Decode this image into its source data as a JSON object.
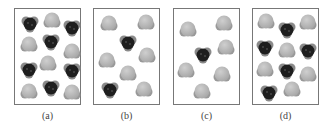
{
  "figure": {
    "panels": [
      {
        "id": "a",
        "label": "(a)",
        "left": 14,
        "molecules": [
          {
            "type": "dark",
            "x": 6,
            "y": 6
          },
          {
            "type": "light",
            "x": 28,
            "y": 3
          },
          {
            "type": "dark",
            "x": 48,
            "y": 10
          },
          {
            "type": "light",
            "x": 5,
            "y": 27
          },
          {
            "type": "dark",
            "x": 27,
            "y": 24
          },
          {
            "type": "light",
            "x": 48,
            "y": 34
          },
          {
            "type": "light",
            "x": 24,
            "y": 46
          },
          {
            "type": "dark",
            "x": 5,
            "y": 52
          },
          {
            "type": "dark",
            "x": 48,
            "y": 53
          },
          {
            "type": "light",
            "x": 5,
            "y": 74
          },
          {
            "type": "dark",
            "x": 27,
            "y": 70
          },
          {
            "type": "light",
            "x": 48,
            "y": 75
          }
        ]
      },
      {
        "id": "b",
        "label": "(b)",
        "left": 93,
        "molecules": [
          {
            "type": "light",
            "x": 6,
            "y": 6
          },
          {
            "type": "light",
            "x": 43,
            "y": 5
          },
          {
            "type": "dark",
            "x": 25,
            "y": 25
          },
          {
            "type": "light",
            "x": 4,
            "y": 43
          },
          {
            "type": "light",
            "x": 44,
            "y": 38
          },
          {
            "type": "light",
            "x": 25,
            "y": 56
          },
          {
            "type": "dark",
            "x": 7,
            "y": 72
          },
          {
            "type": "light",
            "x": 41,
            "y": 72
          }
        ]
      },
      {
        "id": "c",
        "label": "(c)",
        "left": 173,
        "molecules": [
          {
            "type": "light",
            "x": 5,
            "y": 12
          },
          {
            "type": "light",
            "x": 41,
            "y": 6
          },
          {
            "type": "dark",
            "x": 20,
            "y": 37
          },
          {
            "type": "light",
            "x": 43,
            "y": 30
          },
          {
            "type": "light",
            "x": 3,
            "y": 53
          },
          {
            "type": "light",
            "x": 39,
            "y": 57
          },
          {
            "type": "light",
            "x": 19,
            "y": 74
          }
        ]
      },
      {
        "id": "d",
        "label": "(d)",
        "left": 252,
        "molecules": [
          {
            "type": "light",
            "x": 4,
            "y": 4
          },
          {
            "type": "dark",
            "x": 25,
            "y": 12
          },
          {
            "type": "light",
            "x": 46,
            "y": 5
          },
          {
            "type": "dark",
            "x": 3,
            "y": 30
          },
          {
            "type": "light",
            "x": 25,
            "y": 33
          },
          {
            "type": "dark",
            "x": 46,
            "y": 33
          },
          {
            "type": "light",
            "x": 3,
            "y": 52
          },
          {
            "type": "dark",
            "x": 25,
            "y": 53
          },
          {
            "type": "light",
            "x": 46,
            "y": 57
          },
          {
            "type": "dark",
            "x": 7,
            "y": 75
          },
          {
            "type": "light",
            "x": 30,
            "y": 72
          }
        ]
      }
    ],
    "colors": {
      "dark": "#1e1e1e",
      "dark_rim": "#8a8a8a",
      "light": "#a8a8a8",
      "light_hi": "#cfcfcf",
      "border": "#777777"
    }
  }
}
